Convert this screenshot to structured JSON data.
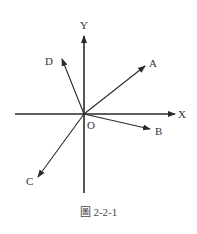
{
  "diagram": {
    "stroke_color": "#2a2a2a",
    "origin": {
      "x": 84,
      "y": 114,
      "label": "O",
      "label_x": 87,
      "label_y": 129
    },
    "axes": [
      {
        "name": "X",
        "label": "X",
        "x1": 15,
        "y1": 114,
        "x2": 175,
        "y2": 114,
        "label_x": 178,
        "label_y": 118
      },
      {
        "name": "Y",
        "label": "Y",
        "x1": 84,
        "y1": 193,
        "x2": 84,
        "y2": 36,
        "label_x": 80,
        "label_y": 29
      }
    ],
    "vectors": [
      {
        "name": "A",
        "label": "A",
        "x2": 145,
        "y2": 66,
        "label_x": 149,
        "label_y": 67
      },
      {
        "name": "B",
        "label": "B",
        "x2": 150,
        "y2": 129,
        "label_x": 155,
        "label_y": 135
      },
      {
        "name": "C",
        "label": "C",
        "x2": 38,
        "y2": 177,
        "label_x": 26,
        "label_y": 185
      },
      {
        "name": "D",
        "label": "D",
        "x2": 62,
        "y2": 59,
        "label_x": 45,
        "label_y": 65
      }
    ]
  },
  "caption": "圖 2-2-1"
}
